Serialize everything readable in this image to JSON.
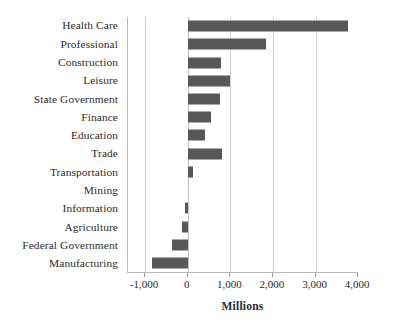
{
  "chart_data": {
    "type": "bar",
    "orientation": "horizontal",
    "title": "",
    "xlabel": "Millions",
    "ylabel": "",
    "xlim": [
      -1400,
      4020
    ],
    "xticks": [
      -1000,
      0,
      1000,
      2000,
      3000,
      4000
    ],
    "xticklabels": [
      "-1,000",
      "0",
      "1,000",
      "2,000",
      "3,000",
      "4,000"
    ],
    "grid": "vertical",
    "legend": "none",
    "bar_color": "#585858",
    "gridline_color": "#cfcfcf",
    "axis_color": "#b9b9b9",
    "categories": [
      "Health Care",
      "Professional",
      "Construction",
      "Leisure",
      "State Government",
      "Finance",
      "Education",
      "Trade",
      "Transportation",
      "Mining",
      "Information",
      "Agriculture",
      "Federal Government",
      "Manufacturing"
    ],
    "values": [
      3770,
      1840,
      775,
      995,
      760,
      550,
      415,
      800,
      120,
      0,
      -60,
      -140,
      -375,
      -830
    ]
  },
  "title_remnant": ""
}
